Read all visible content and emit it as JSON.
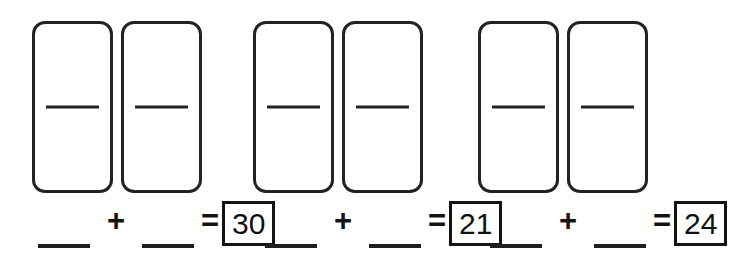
{
  "worksheet": {
    "title": "Domino addition worksheet",
    "background_color": "#ffffff",
    "ink_color": "#1a1a1a"
  },
  "dominoes": {
    "groups": [
      {
        "id": "domino-pair-1",
        "tiles": [
          {
            "id": "domino-1a",
            "top_pips": "",
            "bottom_pips": ""
          },
          {
            "id": "domino-1b",
            "top_pips": "",
            "bottom_pips": ""
          }
        ]
      },
      {
        "id": "domino-pair-2",
        "tiles": [
          {
            "id": "domino-2a",
            "top_pips": "",
            "bottom_pips": ""
          },
          {
            "id": "domino-2b",
            "top_pips": "",
            "bottom_pips": ""
          }
        ]
      },
      {
        "id": "domino-pair-3",
        "tiles": [
          {
            "id": "domino-3a",
            "top_pips": "",
            "bottom_pips": ""
          },
          {
            "id": "domino-3b",
            "top_pips": "",
            "bottom_pips": ""
          }
        ]
      }
    ]
  },
  "equations": [
    {
      "id": "equation-1",
      "addend_1": "",
      "plus": "+",
      "addend_2": "",
      "equals": "=",
      "sum": "30"
    },
    {
      "id": "equation-2",
      "addend_1": "",
      "plus": "+",
      "addend_2": "",
      "equals": "=",
      "sum": "21"
    },
    {
      "id": "equation-3",
      "addend_1": "",
      "plus": "+",
      "addend_2": "",
      "equals": "=",
      "sum": "24"
    }
  ]
}
